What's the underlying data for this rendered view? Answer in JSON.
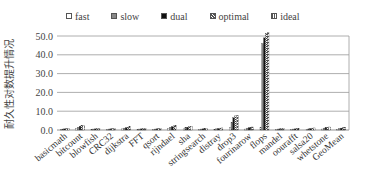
{
  "chart_data": {
    "type": "bar",
    "title": "",
    "xlabel": "",
    "ylabel": "耐久性对数提升情况",
    "ylim": [
      0,
      50
    ],
    "yticks": [
      "0.0",
      "10.0",
      "20.0",
      "30.0",
      "40.0",
      "50.0"
    ],
    "grid": true,
    "legend_position": "top",
    "categories": [
      "basicmath",
      "bitcount",
      "blowfish",
      "CRC32",
      "dijkstra",
      "FFT",
      "qsort",
      "rijndael",
      "sha",
      "stringsearch",
      "distray",
      "drop3",
      "fourinarow",
      "flops",
      "mandel",
      "oourafft",
      "salsa20",
      "whetstone",
      "GeoMean"
    ],
    "series": [
      {
        "name": "fast",
        "values": [
          0.3,
          0.8,
          0.3,
          0.3,
          0.6,
          0.3,
          0.3,
          0.8,
          0.6,
          0.3,
          0.3,
          1.2,
          0.5,
          1.5,
          0.3,
          0.3,
          0.3,
          0.5,
          0.4
        ]
      },
      {
        "name": "slow",
        "values": [
          0.5,
          1.5,
          0.5,
          0.5,
          1.0,
          0.5,
          0.5,
          1.5,
          1.2,
          0.5,
          0.6,
          4.0,
          1.0,
          46.0,
          0.5,
          0.5,
          0.6,
          1.0,
          0.8
        ]
      },
      {
        "name": "dual",
        "values": [
          0.6,
          2.0,
          0.6,
          0.6,
          1.2,
          0.6,
          0.6,
          1.8,
          1.5,
          0.6,
          0.8,
          6.5,
          1.2,
          49.0,
          0.6,
          0.6,
          0.8,
          1.2,
          1.0
        ]
      },
      {
        "name": "optimal",
        "values": [
          0.8,
          2.3,
          0.8,
          0.8,
          1.5,
          0.8,
          0.8,
          2.2,
          1.8,
          0.8,
          1.0,
          7.5,
          1.5,
          51.5,
          0.8,
          0.8,
          1.0,
          1.5,
          1.3
        ]
      },
      {
        "name": "ideal",
        "values": [
          0.9,
          2.5,
          0.9,
          0.9,
          1.7,
          0.9,
          0.9,
          2.4,
          2.0,
          0.9,
          1.1,
          7.8,
          1.6,
          52.0,
          0.9,
          0.9,
          1.1,
          1.6,
          1.4
        ]
      }
    ]
  },
  "legend": {
    "items": [
      {
        "label": "fast",
        "fill": "#ffffff"
      },
      {
        "label": "slow",
        "fill": "#888888"
      },
      {
        "label": "dual",
        "fill": "#111111"
      },
      {
        "label": "optimal",
        "fill": "pattern-cross"
      },
      {
        "label": "ideal",
        "fill": "pattern-check"
      }
    ]
  },
  "colors": {
    "axis": "#888888",
    "grid": "#999999",
    "text": "#333333"
  }
}
